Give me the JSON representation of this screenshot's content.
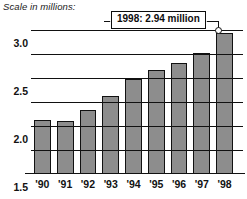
{
  "caption": "Scale in millions:",
  "callout": {
    "text": "1998: 2.94 million",
    "marker": "data-point-marker"
  },
  "chart_data": {
    "type": "bar",
    "title": "Scale in millions:",
    "xlabel": "",
    "ylabel": "",
    "categories": [
      "'90",
      "'91",
      "'92",
      "'93",
      "'94",
      "'95",
      "'96",
      "'97",
      "'98"
    ],
    "values": [
      1.12,
      1.11,
      1.33,
      1.62,
      1.97,
      2.16,
      2.31,
      2.52,
      2.94
    ],
    "ylim": [
      0,
      3.25
    ],
    "yticks": [
      0.5,
      1.0,
      1.5,
      2.0,
      2.5,
      3.0
    ],
    "ytick_labels": [
      "0.5",
      "1.0",
      "1.5",
      "2.0",
      "2.5",
      "3.0"
    ],
    "grid": true,
    "legend": false,
    "bar_color": "#8d8d8d",
    "bar_edge_color": "#111111",
    "annotations": [
      {
        "label": "1998: 2.94 million",
        "x": "'98",
        "y": 2.94
      }
    ]
  }
}
